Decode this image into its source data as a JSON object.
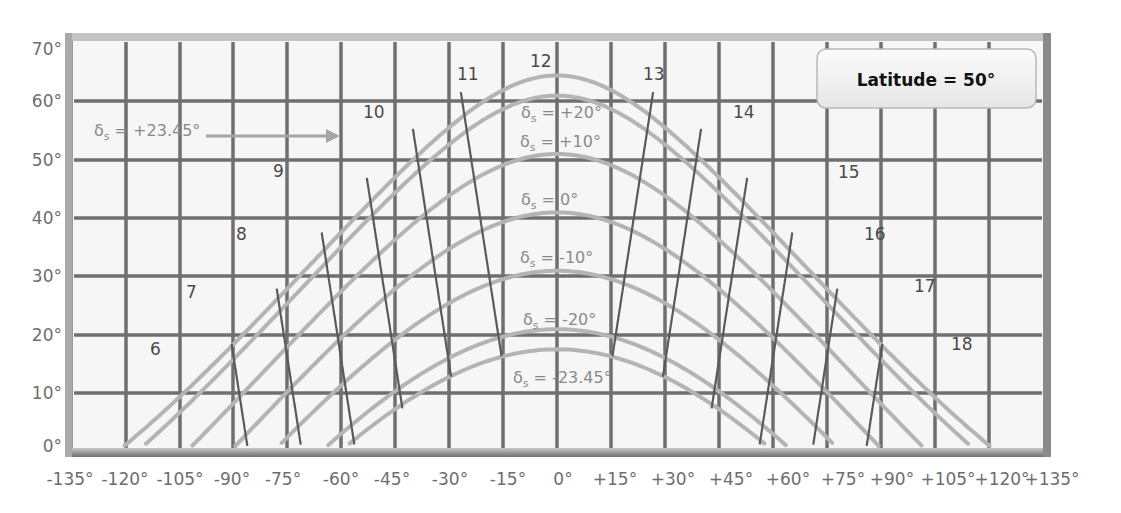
{
  "chart_data": {
    "type": "line",
    "title": "Latitude = 50°",
    "xlabel": "Hour angle",
    "ylabel": "Solar altitude",
    "xlim": [
      -135,
      135
    ],
    "ylim": [
      0,
      70
    ],
    "grid": true,
    "x_ticks": [
      "-135°",
      "-120°",
      "-105°",
      "-90°",
      "-75°",
      "-60°",
      "-45°",
      "-30°",
      "-15°",
      "0°",
      "+15°",
      "+30°",
      "+45°",
      "+60°",
      "+75°",
      "+90°",
      "+105°",
      "+120°",
      "+135°"
    ],
    "y_ticks": [
      "0°",
      "10°",
      "20°",
      "30°",
      "40°",
      "50°",
      "60°",
      "70°"
    ],
    "annotation_box": "Latitude = 50°",
    "declination_series": [
      {
        "name": "δs = +23.45°",
        "label": "δs = +23.45°",
        "decl": 23.45,
        "peak_altitude": 63.45
      },
      {
        "name": "δs = +20°",
        "label": "δs = +20°",
        "decl": 20,
        "peak_altitude": 60
      },
      {
        "name": "δs = +10°",
        "label": "δs = +10°",
        "decl": 10,
        "peak_altitude": 50
      },
      {
        "name": "δs = 0°",
        "label": "δs = 0°",
        "decl": 0,
        "peak_altitude": 40
      },
      {
        "name": "δs = -10°",
        "label": "δs = -10°",
        "decl": -10,
        "peak_altitude": 30
      },
      {
        "name": "δs = -20°",
        "label": "δs = -20°",
        "decl": -20,
        "peak_altitude": 20
      },
      {
        "name": "δs = -23.45°",
        "label": "δs = -23.45°",
        "decl": -23.45,
        "peak_altitude": 16.55
      }
    ],
    "hour_lines": [
      "6",
      "7",
      "8",
      "9",
      "10",
      "11",
      "12",
      "13",
      "14",
      "15",
      "16",
      "17",
      "18"
    ]
  },
  "labels": {
    "lat_box": "Latitude = 50°",
    "decl_prefix": "δ",
    "decl_sub": "s",
    "decl_values": {
      "p2345": " = +23.45°",
      "p20": " = +20°",
      "p10": " = +10°",
      "z0": " = 0°",
      "m10": " = -10°",
      "m20": " = -20°",
      "m2345": " = -23.45°"
    },
    "hours": {
      "h6": "6",
      "h7": "7",
      "h8": "8",
      "h9": "9",
      "h10": "10",
      "h11": "11",
      "h12": "12",
      "h13": "13",
      "h14": "14",
      "h15": "15",
      "h16": "16",
      "h17": "17",
      "h18": "18"
    },
    "xticks": {
      "t0": "-135°",
      "t1": "-120°",
      "t2": "-105°",
      "t3": "-90°",
      "t4": "-75°",
      "t5": "-60°",
      "t6": "-45°",
      "t7": "-30°",
      "t8": "-15°",
      "t9": "0°",
      "t10": "+15°",
      "t11": "+30°",
      "t12": "+45°",
      "t13": "+60°",
      "t14": "+75°",
      "t15": "+90°",
      "t16": "+105°",
      "t17": "+120°",
      "t18": "+135°"
    },
    "yticks": {
      "y0": "0°",
      "y10": "10°",
      "y20": "20°",
      "y30": "30°",
      "y40": "40°",
      "y50": "50°",
      "y60": "60°",
      "y70": "70°"
    }
  },
  "colors": {
    "frame": "#8c8c8c",
    "grid": "#6f6f6f",
    "sun_path": "#b4b4b4",
    "hour_line": "#5a5a5a",
    "plot_bg": "#f6f6f6"
  }
}
